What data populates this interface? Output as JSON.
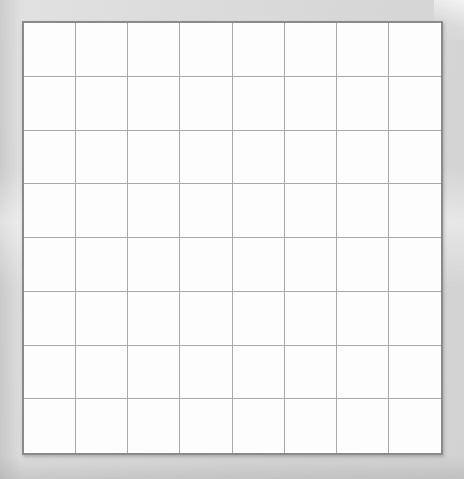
{
  "page": {
    "background_color": "#d9d9d9",
    "paper_color": "#dcdcdc",
    "grid_background": "#fdfdfd",
    "grid_border_color": "#8a8a8a",
    "cell_line_color": "#a9a9a9",
    "printed_mark_color": "#dadada",
    "handwritten_mark_color": "#1d1d1d"
  },
  "grid": {
    "rows": 8,
    "columns": 8,
    "legend": {
      "empty": "",
      "printed_o": "O (printed)",
      "printed_x": "X (printed)",
      "hand_o": "O (handwritten)",
      "hand_x": "X (handwritten)"
    },
    "cells": [
      [
        "printed_o",
        "printed_o",
        "printed_x",
        "printed_x",
        "hand_x",
        "hand_o",
        "printed_x",
        "printed_o"
      ],
      [
        "hand_x",
        "printed_o",
        "printed_x",
        "hand_o",
        "printed_x",
        "empty",
        "empty",
        "printed_o"
      ],
      [
        "printed_o",
        "hand_x",
        "hand_o",
        "printed_x",
        "empty",
        "printed_x",
        "printed_o",
        "printed_o"
      ],
      [
        "hand_o",
        "printed_o",
        "empty",
        "printed_x",
        "empty",
        "empty",
        "empty",
        "hand_x"
      ],
      [
        "hand_x",
        "hand_o",
        "empty",
        "empty",
        "printed_x",
        "empty",
        "printed_o",
        "printed_x"
      ],
      [
        "printed_x",
        "printed_x",
        "empty",
        "empty",
        "printed_o",
        "printed_x",
        "empty",
        "printed_o"
      ],
      [
        "printed_o",
        "empty",
        "printed_o",
        "empty",
        "printed_x",
        "empty",
        "hand_o",
        "printed_x"
      ],
      [
        "printed_x",
        "printed_x",
        "empty",
        "empty",
        "printed_o",
        "printed_x",
        "empty",
        "printed_x"
      ]
    ]
  }
}
